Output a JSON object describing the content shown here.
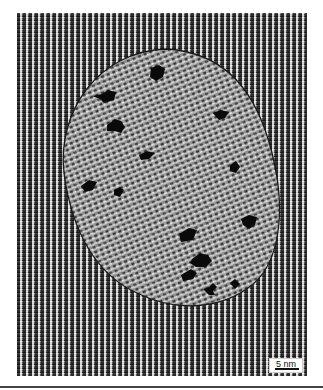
{
  "image": {
    "description": "TEM micrograph of a nanoparticle with lattice fringes and dark inclusions",
    "scale_bar": {
      "label": "5 nm"
    }
  }
}
